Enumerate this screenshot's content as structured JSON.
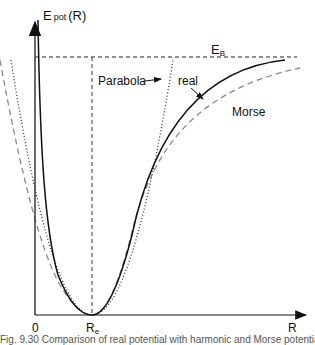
{
  "diagram": {
    "type": "potential-energy-curve",
    "y_axis": {
      "label_main": "E",
      "label_sub": "pot",
      "label_arg": "(R)"
    },
    "x_axis": {
      "label": "R",
      "ticks": [
        {
          "label": "0"
        },
        {
          "label_main": "R",
          "label_sub": "e"
        }
      ]
    },
    "levels": {
      "binding_energy": {
        "label_main": "E",
        "label_sub": "B"
      }
    },
    "curves": [
      {
        "name": "Parabola",
        "style": "dotted",
        "color": "#333333"
      },
      {
        "name": "real",
        "style": "solid",
        "color": "#111111"
      },
      {
        "name": "Morse",
        "style": "dashed",
        "color": "#888888"
      }
    ],
    "annotations": {
      "parabola_label": "Parabola",
      "real_label": "real",
      "morse_label": "Morse"
    },
    "caption": "Fig. 9.30 Comparison of real potential with harmonic and Morse potential"
  }
}
